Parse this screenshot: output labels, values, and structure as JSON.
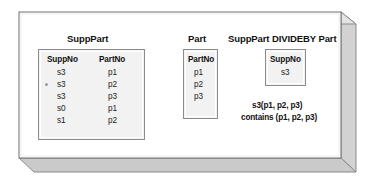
{
  "figure": {
    "background_color": "#ffffff",
    "frame": {
      "name": "three-d-slab-frame",
      "face_color": "#ffffff",
      "edge_color": "#6e6e6e",
      "extrusion_color": "#cfcfcf",
      "extrusion_shade_color": "#b5b5b5"
    }
  },
  "panels": {
    "supppart": {
      "title": "SuppPart",
      "columns": [
        "SuppNo",
        "PartNo"
      ],
      "rows": [
        {
          "SuppNo": "s3",
          "PartNo": "p1",
          "marked": false
        },
        {
          "SuppNo": "s3",
          "PartNo": "p2",
          "marked": true
        },
        {
          "SuppNo": "s3",
          "PartNo": "p3",
          "marked": false
        },
        {
          "SuppNo": "s0",
          "PartNo": "p1",
          "marked": false
        },
        {
          "SuppNo": "s1",
          "PartNo": "p2",
          "marked": false
        }
      ]
    },
    "part": {
      "title": "Part",
      "columns": [
        "PartNo"
      ],
      "rows": [
        {
          "PartNo": "p1"
        },
        {
          "PartNo": "p2"
        },
        {
          "PartNo": "p3"
        }
      ]
    },
    "result": {
      "title": "SuppPart DIVIDEBY Part",
      "columns": [
        "SuppNo"
      ],
      "rows": [
        {
          "SuppNo": "s3"
        }
      ],
      "caption": [
        "s3(p1, p2, p3)",
        "contains (p1, p2, p3)"
      ]
    }
  }
}
